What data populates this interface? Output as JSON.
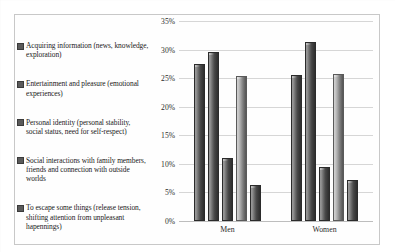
{
  "chart_data": {
    "type": "bar",
    "title": "",
    "xlabel": "",
    "ylabel": "",
    "ylim": [
      0,
      35
    ],
    "ytick_labels": [
      "35%",
      "30%",
      "25%",
      "20%",
      "15%",
      "10%",
      "5%",
      "0%"
    ],
    "ytick_values": [
      35,
      30,
      25,
      20,
      15,
      10,
      5,
      0
    ],
    "grid": true,
    "legend_position": "left",
    "categories": [
      "Men",
      "Women"
    ],
    "series": [
      {
        "name": "Acquiring information (news, knowledge, exploration)",
        "color": "#6f6f6f",
        "values": [
          27.5,
          25.6
        ]
      },
      {
        "name": "Entertainment and pleasure (emotional experiences)",
        "color": "#4a4a4a",
        "values": [
          29.5,
          31.3
        ]
      },
      {
        "name": "Personal identity (personal stability, social status, need for self-respect)",
        "color": "#5a5a5a",
        "values": [
          11.0,
          9.5
        ]
      },
      {
        "name": "Social interactions with family members, friends and connection with outside worlds",
        "color": "#b0b0b0",
        "values": [
          25.3,
          25.7
        ]
      },
      {
        "name": "To escape some things (release tension, shifting attention from unpleasant hapennings)",
        "color": "#3b3b3b",
        "values": [
          6.3,
          7.2
        ]
      }
    ]
  },
  "legend": {
    "items": [
      {
        "marker": "legend-swatch-icon",
        "label": "Acquiring information (news, knowledge, exploration)"
      },
      {
        "marker": "legend-swatch-icon",
        "label": "Entertainment and pleasure (emotional experiences)"
      },
      {
        "marker": "legend-swatch-icon",
        "label": "Personal identity (personal stability, social status, need for self-respect)"
      },
      {
        "marker": "legend-swatch-icon",
        "label": "Social interactions with family members, friends and connection with outside worlds"
      },
      {
        "marker": "legend-swatch-icon",
        "label": "To escape some things (release tension, shifting attention from unpleasant hapennings)"
      }
    ]
  },
  "axes": {
    "y_ticks": [
      "35%",
      "30%",
      "25%",
      "20%",
      "15%",
      "10%",
      "5%",
      "0%"
    ],
    "x_categories": [
      "Men",
      "Women"
    ]
  }
}
